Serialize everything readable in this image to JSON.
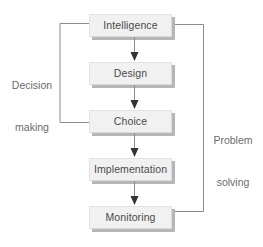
{
  "diagram": {
    "colors": {
      "box_fill": "#f1f1f1",
      "box_border": "#dcdcdc",
      "box_shadow": "#b6b6b6",
      "text": "#4a4a4a",
      "label_text": "#6b6b6b",
      "connector": "#8c8c8c",
      "arrow_head": "#333333",
      "background": "#ffffff"
    },
    "nodes": [
      {
        "id": "intelligence",
        "label": "Intelligence"
      },
      {
        "id": "design",
        "label": "Design"
      },
      {
        "id": "choice",
        "label": "Choice"
      },
      {
        "id": "implementation",
        "label": "Implementation"
      },
      {
        "id": "monitoring",
        "label": "Monitoring"
      }
    ],
    "flow_arrows": [
      {
        "id": "arrow-1",
        "from": "intelligence",
        "to": "design"
      },
      {
        "id": "arrow-2",
        "from": "design",
        "to": "choice"
      },
      {
        "id": "arrow-3",
        "from": "choice",
        "to": "implementation"
      },
      {
        "id": "arrow-4",
        "from": "implementation",
        "to": "monitoring"
      }
    ],
    "loops": [
      {
        "id": "decision-making",
        "label_line1": "Decision",
        "label_line2": "making",
        "side": "left",
        "from": "choice",
        "to": "intelligence"
      },
      {
        "id": "problem-solving",
        "label_line1": "Problem",
        "label_line2": "solving",
        "side": "right",
        "from": "monitoring",
        "to": "intelligence"
      }
    ]
  }
}
